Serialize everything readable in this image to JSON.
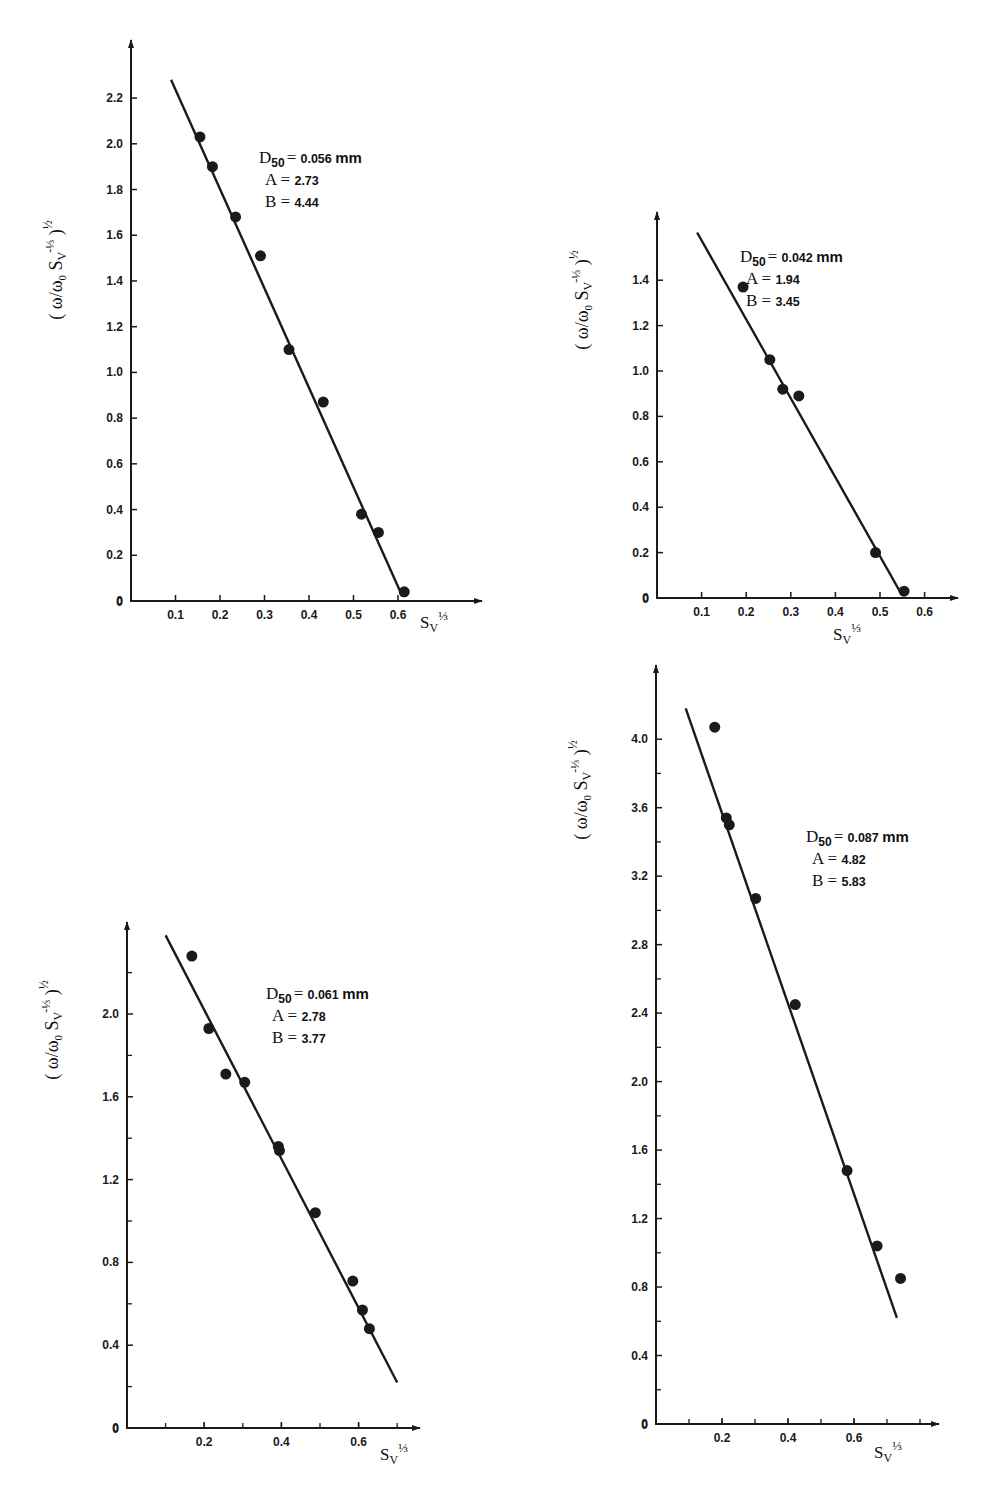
{
  "figure": {
    "ylabel": "(ω/ω₀ · Sv^(-1/3))^(1/2)",
    "xlabel": "Sv^(1/3)"
  },
  "chart_data": [
    {
      "type": "scatter",
      "panel": "top-left",
      "title": "",
      "xlabel": "Sv^(1/3)",
      "ylabel": "(ω/ω0 Sv^(-1/3))^(1/2)",
      "annotation": {
        "D50": "0.056 mm",
        "A": "2.73",
        "B": "4.44"
      },
      "x_ticks": [
        "0.1",
        "0.2",
        "0.3",
        "0.4",
        "0.5",
        "0.6"
      ],
      "y_ticks": [
        "0",
        "0.2",
        "0.4",
        "0.6",
        "0.8",
        "1.0",
        "1.2",
        "1.4",
        "1.6",
        "1.8",
        "2.0",
        "2.2"
      ],
      "xlim": [
        0,
        0.78
      ],
      "ylim": [
        0,
        2.45
      ],
      "grid": false,
      "series": [
        {
          "name": "measured",
          "x": [
            0.155,
            0.183,
            0.235,
            0.291,
            0.355,
            0.432,
            0.518,
            0.556,
            0.614
          ],
          "y": [
            2.03,
            1.9,
            1.68,
            1.51,
            1.1,
            0.87,
            0.38,
            0.3,
            0.04
          ]
        },
        {
          "name": "fit",
          "x": [
            0.09,
            0.61
          ],
          "y": [
            2.28,
            0.02
          ]
        }
      ]
    },
    {
      "type": "scatter",
      "panel": "top-right",
      "title": "",
      "xlabel": "Sv^(1/3)",
      "ylabel": "(ω/ω0 Sv^(-1/3))^(1/2)",
      "annotation": {
        "D50": "0.042 mm",
        "A": "1.94",
        "B": "3.45"
      },
      "x_ticks": [
        "0.1",
        "0.2",
        "0.3",
        "0.4",
        "0.5",
        "0.6"
      ],
      "y_ticks": [
        "0",
        "0.2",
        "0.4",
        "0.6",
        "0.8",
        "1.0",
        "1.2",
        "1.4"
      ],
      "xlim": [
        0,
        0.68
      ],
      "ylim": [
        0,
        1.7
      ],
      "grid": false,
      "series": [
        {
          "name": "measured",
          "x": [
            0.193,
            0.253,
            0.282,
            0.318,
            0.49,
            0.554
          ],
          "y": [
            1.37,
            1.05,
            0.92,
            0.89,
            0.2,
            0.03
          ]
        },
        {
          "name": "fit",
          "x": [
            0.09,
            0.55
          ],
          "y": [
            1.61,
            0.01
          ]
        }
      ]
    },
    {
      "type": "scatter",
      "panel": "bottom-left",
      "title": "",
      "xlabel": "Sv^(1/3)",
      "ylabel": "(ω/ω0 Sv^(-1/3))^(1/2)",
      "annotation": {
        "D50": "0.061 mm",
        "A": "2.78",
        "B": "3.77"
      },
      "x_ticks": [
        "0.2",
        "0.4",
        "0.6"
      ],
      "y_ticks": [
        "0",
        "0.4",
        "0.8",
        "1.2",
        "1.6",
        "2.0"
      ],
      "xlim": [
        0,
        0.76
      ],
      "ylim": [
        0,
        2.45
      ],
      "grid": false,
      "series": [
        {
          "name": "measured",
          "x": [
            0.168,
            0.212,
            0.256,
            0.305,
            0.392,
            0.395,
            0.488,
            0.585,
            0.61,
            0.628
          ],
          "y": [
            2.28,
            1.93,
            1.71,
            1.67,
            1.36,
            1.34,
            1.04,
            0.71,
            0.57,
            0.48
          ]
        },
        {
          "name": "fit",
          "x": [
            0.1,
            0.7
          ],
          "y": [
            2.38,
            0.22
          ]
        }
      ]
    },
    {
      "type": "scatter",
      "panel": "bottom-right",
      "title": "",
      "xlabel": "Sv^(1/3)",
      "ylabel": "(ω/ω0 Sv^(-1/3))^(1/2)",
      "annotation": {
        "D50": "0.087 mm",
        "A": "4.82",
        "B": "5.83"
      },
      "x_ticks": [
        "0.2",
        "0.4",
        "0.6"
      ],
      "y_ticks": [
        "0",
        "0.4",
        "0.8",
        "1.2",
        "1.6",
        "2.0",
        "2.4",
        "2.8",
        "3.2",
        "3.6",
        "4.0"
      ],
      "xlim": [
        0,
        0.88
      ],
      "ylim": [
        0,
        4.45
      ],
      "grid": false,
      "series": [
        {
          "name": "measured",
          "x": [
            0.178,
            0.213,
            0.222,
            0.302,
            0.422,
            0.579,
            0.67,
            0.741
          ],
          "y": [
            4.07,
            3.54,
            3.5,
            3.07,
            2.45,
            1.48,
            1.04,
            0.85
          ]
        },
        {
          "name": "fit",
          "x": [
            0.09,
            0.73
          ],
          "y": [
            4.18,
            0.62
          ]
        }
      ]
    }
  ]
}
